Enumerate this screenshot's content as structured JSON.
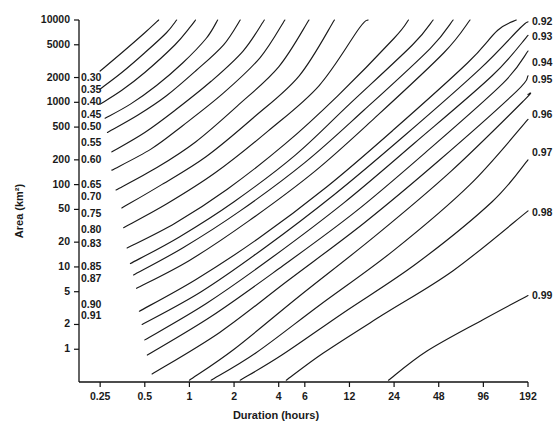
{
  "chart_data": {
    "type": "line",
    "title": "",
    "xlabel": "Duration (hours)",
    "ylabel": "Area (km²)",
    "x_scale": "log",
    "y_scale": "log",
    "xlim": [
      0.18,
      192
    ],
    "ylim": [
      0.4,
      10000
    ],
    "grid": false,
    "legend": "none",
    "xticks": [
      {
        "value": 0.25,
        "label": "0.25"
      },
      {
        "value": 0.5,
        "label": "0.5"
      },
      {
        "value": 1,
        "label": "1"
      },
      {
        "value": 2,
        "label": "2"
      },
      {
        "value": 4,
        "label": "4"
      },
      {
        "value": 6,
        "label": "6"
      },
      {
        "value": 12,
        "label": "12"
      },
      {
        "value": 24,
        "label": "24"
      },
      {
        "value": 48,
        "label": "48"
      },
      {
        "value": 96,
        "label": "96"
      },
      {
        "value": 192,
        "label": "192"
      }
    ],
    "yticks": [
      {
        "value": 10000,
        "label": "10000"
      },
      {
        "value": 5000,
        "label": "5000"
      },
      {
        "value": 2000,
        "label": "2000"
      },
      {
        "value": 1000,
        "label": "1000"
      },
      {
        "value": 500,
        "label": "500"
      },
      {
        "value": 200,
        "label": "200"
      },
      {
        "value": 100,
        "label": "100"
      },
      {
        "value": 50,
        "label": "50"
      },
      {
        "value": 20,
        "label": "20"
      },
      {
        "value": 10,
        "label": "10"
      },
      {
        "value": 5,
        "label": "5"
      },
      {
        "value": 2,
        "label": "2"
      },
      {
        "value": 1,
        "label": "1"
      }
    ],
    "series": [
      {
        "name": "0.30",
        "label": "0.30",
        "label_side": "left",
        "label_y": 2000,
        "points": [
          [
            0.25,
            2400
          ],
          [
            0.35,
            4000
          ],
          [
            0.5,
            7000
          ],
          [
            0.62,
            10000
          ]
        ]
      },
      {
        "name": "0.35",
        "label": "0.35",
        "label_side": "left",
        "label_y": 1400,
        "points": [
          [
            0.25,
            1450
          ],
          [
            0.35,
            2300
          ],
          [
            0.5,
            4000
          ],
          [
            0.7,
            7000
          ],
          [
            0.82,
            10000
          ]
        ]
      },
      {
        "name": "0.40",
        "label": "0.40",
        "label_side": "left",
        "label_y": 1000,
        "points": [
          [
            0.25,
            950
          ],
          [
            0.35,
            1400
          ],
          [
            0.5,
            2300
          ],
          [
            0.8,
            5000
          ],
          [
            1.0,
            8000
          ],
          [
            1.1,
            10000
          ]
        ]
      },
      {
        "name": "0.45",
        "label": "0.45",
        "label_side": "left",
        "label_y": 700,
        "points": [
          [
            0.27,
            640
          ],
          [
            0.4,
            950
          ],
          [
            0.6,
            1600
          ],
          [
            0.9,
            3000
          ],
          [
            1.3,
            6000
          ],
          [
            1.55,
            10000
          ]
        ]
      },
      {
        "name": "0.50",
        "label": "0.50",
        "label_side": "left",
        "label_y": 500,
        "points": [
          [
            0.28,
            430
          ],
          [
            0.45,
            700
          ],
          [
            0.7,
            1200
          ],
          [
            1.1,
            2400
          ],
          [
            1.7,
            5000
          ],
          [
            2.2,
            10000
          ]
        ]
      },
      {
        "name": "0.55",
        "label": "0.55",
        "label_side": "left",
        "label_y": 320,
        "points": [
          [
            0.3,
            250
          ],
          [
            0.5,
            430
          ],
          [
            0.8,
            800
          ],
          [
            1.4,
            1800
          ],
          [
            2.3,
            4200
          ],
          [
            3.2,
            10000
          ]
        ]
      },
      {
        "name": "0.60",
        "label": "0.60",
        "label_side": "left",
        "label_y": 200,
        "points": [
          [
            0.3,
            150
          ],
          [
            0.55,
            270
          ],
          [
            0.9,
            520
          ],
          [
            1.7,
            1300
          ],
          [
            3.0,
            3500
          ],
          [
            4.4,
            10000
          ]
        ]
      },
      {
        "name": "0.65",
        "label": "0.65",
        "label_side": "left",
        "label_y": 100,
        "points": [
          [
            0.32,
            86
          ],
          [
            0.6,
            160
          ],
          [
            1.1,
            330
          ],
          [
            2.1,
            900
          ],
          [
            4.0,
            2700
          ],
          [
            6.4,
            10000
          ]
        ]
      },
      {
        "name": "0.70",
        "label": "0.70",
        "label_side": "left",
        "label_y": 70,
        "points": [
          [
            0.35,
            52
          ],
          [
            0.65,
            100
          ],
          [
            1.3,
            220
          ],
          [
            2.7,
            650
          ],
          [
            5.5,
            2100
          ],
          [
            9.5,
            10000
          ]
        ]
      },
      {
        "name": "0.75",
        "label": "0.75",
        "label_side": "left",
        "label_y": 44,
        "points": [
          [
            0.36,
            30
          ],
          [
            0.7,
            58
          ],
          [
            1.5,
            140
          ],
          [
            3.4,
            450
          ],
          [
            7.5,
            1600
          ],
          [
            14,
            8000
          ],
          [
            16,
            10000
          ]
        ]
      },
      {
        "name": "0.80",
        "label": "0.80",
        "label_side": "left",
        "label_y": 28,
        "points": [
          [
            0.38,
            17
          ],
          [
            0.8,
            34
          ],
          [
            1.8,
            88
          ],
          [
            4.4,
            310
          ],
          [
            10,
            1200
          ],
          [
            24,
            6000
          ],
          [
            30,
            10000
          ]
        ]
      },
      {
        "name": "0.83",
        "label": "0.83",
        "label_side": "left",
        "label_y": 19,
        "points": [
          [
            0.4,
            11
          ],
          [
            0.85,
            23
          ],
          [
            2.0,
            62
          ],
          [
            5.2,
            230
          ],
          [
            12,
            950
          ],
          [
            32,
            5000
          ],
          [
            44,
            10000
          ]
        ]
      },
      {
        "name": "0.85",
        "label": "0.85",
        "label_side": "left",
        "label_y": 10,
        "points": [
          [
            0.42,
            8
          ],
          [
            0.9,
            17
          ],
          [
            2.2,
            48
          ],
          [
            6.0,
            185
          ],
          [
            15,
            800
          ],
          [
            42,
            4500
          ],
          [
            60,
            10000
          ]
        ]
      },
      {
        "name": "0.87",
        "label": "0.87",
        "label_side": "left",
        "label_y": 7.2,
        "points": [
          [
            0.44,
            5.5
          ],
          [
            1.0,
            12
          ],
          [
            2.5,
            36
          ],
          [
            7.0,
            145
          ],
          [
            18,
            660
          ],
          [
            52,
            4000
          ],
          [
            78,
            10000
          ]
        ]
      },
      {
        "name": "0.90",
        "label": "0.90",
        "label_side": "left",
        "label_y": 3.4,
        "points": [
          [
            0.46,
            2.9
          ],
          [
            1.1,
            7
          ],
          [
            2.9,
            22
          ],
          [
            8.5,
            95
          ],
          [
            24,
            470
          ],
          [
            75,
            3000
          ],
          [
            120,
            7500
          ],
          [
            160,
            10000
          ]
        ]
      },
      {
        "name": "0.91",
        "label": "0.91",
        "label_side": "left",
        "label_y": 2.5,
        "points": [
          [
            0.48,
            2.0
          ],
          [
            1.2,
            5
          ],
          [
            3.2,
            17
          ],
          [
            9.5,
            76
          ],
          [
            28,
            390
          ],
          [
            90,
            2500
          ],
          [
            170,
            8000
          ],
          [
            192,
            9500
          ]
        ]
      },
      {
        "name": "0.92",
        "label": "0.92",
        "label_side": "right",
        "label_y": 9500,
        "points": [
          [
            0.5,
            1.3
          ],
          [
            1.3,
            3.6
          ],
          [
            3.6,
            13
          ],
          [
            11,
            60
          ],
          [
            33,
            320
          ],
          [
            110,
            2100
          ],
          [
            192,
            6500
          ]
        ]
      },
      {
        "name": "0.93",
        "label": "0.93",
        "label_side": "right",
        "label_y": 6200,
        "points": [
          [
            0.52,
            0.85
          ],
          [
            1.4,
            2.5
          ],
          [
            4.0,
            9.5
          ],
          [
            13,
            46
          ],
          [
            40,
            255
          ],
          [
            130,
            1700
          ],
          [
            192,
            4200
          ]
        ]
      },
      {
        "name": "0.94",
        "label": "0.94",
        "label_side": "right",
        "label_y": 3000,
        "points": [
          [
            0.56,
            0.5
          ],
          [
            1.6,
            1.6
          ],
          [
            4.6,
            6.8
          ],
          [
            15,
            34
          ],
          [
            48,
            195
          ],
          [
            160,
            1350
          ],
          [
            192,
            2100
          ]
        ]
      },
      {
        "name": "0.95",
        "label": "0.95",
        "label_side": "right",
        "label_y": 1850,
        "points": [
          [
            1.0,
            0.42
          ],
          [
            2.0,
            1.0
          ],
          [
            5.5,
            4.4
          ],
          [
            18,
            24
          ],
          [
            58,
            145
          ],
          [
            180,
            1050
          ],
          [
            192,
            1250
          ]
        ]
      },
      {
        "name": "0.96",
        "label": "0.96",
        "label_side": "right",
        "label_y": 700,
        "points": [
          [
            1.4,
            0.42
          ],
          [
            2.8,
            0.9
          ],
          [
            7.5,
            3.4
          ],
          [
            24,
            16
          ],
          [
            78,
            100
          ],
          [
            192,
            620
          ]
        ]
      },
      {
        "name": "0.97",
        "label": "0.97",
        "label_side": "right",
        "label_y": 240,
        "points": [
          [
            2.2,
            0.42
          ],
          [
            4.2,
            0.85
          ],
          [
            11,
            2.8
          ],
          [
            34,
            11
          ],
          [
            110,
            62
          ],
          [
            192,
            200
          ]
        ]
      },
      {
        "name": "0.98",
        "label": "0.98",
        "label_side": "right",
        "label_y": 45,
        "points": [
          [
            4.5,
            0.42
          ],
          [
            8.0,
            0.9
          ],
          [
            20,
            2.6
          ],
          [
            60,
            9
          ],
          [
            192,
            48
          ]
        ]
      },
      {
        "name": "0.99",
        "label": "0.99",
        "label_side": "right",
        "label_y": 4.4,
        "points": [
          [
            22,
            0.42
          ],
          [
            40,
            0.95
          ],
          [
            96,
            2.3
          ],
          [
            192,
            4.5
          ]
        ]
      }
    ]
  },
  "axes": {
    "x_axis_name": "duration-axis",
    "y_axis_name": "area-axis"
  }
}
